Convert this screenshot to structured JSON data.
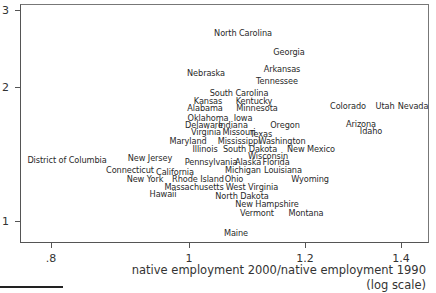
{
  "chart_data": {
    "type": "scatter",
    "title": "",
    "xlabel": "native employment 2000/native employment 1990 (log scale)",
    "xlabel_lines": [
      "native employment 2000/native employment 1990",
      "(log scale)"
    ],
    "ylabel": "",
    "x_scale": "log",
    "y_scale": "log",
    "xlim": [
      0.75,
      1.45
    ],
    "ylim": [
      0.93,
      3.05
    ],
    "grid": false,
    "legend": "none",
    "marker": "text-labels",
    "x_ticks": [
      {
        "label": ".8",
        "px": 51
      },
      {
        "label": "1",
        "px": 189
      },
      {
        "label": "1.2",
        "px": 305
      },
      {
        "label": "1.4",
        "px": 401
      }
    ],
    "y_ticks": [
      {
        "label": "3",
        "py": 10
      },
      {
        "label": "2",
        "py": 87
      },
      {
        "label": "1",
        "py": 221
      }
    ],
    "points": [
      {
        "label": "North Carolina",
        "x": 1.12,
        "y": 2.62,
        "px": 243,
        "py": 33
      },
      {
        "label": "Georgia",
        "x": 1.18,
        "y": 2.38,
        "px": 289,
        "py": 52
      },
      {
        "label": "Arkansas",
        "x": 1.15,
        "y": 2.15,
        "px": 282,
        "py": 69
      },
      {
        "label": "Nebraska",
        "x": 1.03,
        "y": 2.11,
        "px": 206,
        "py": 73
      },
      {
        "label": "Tennessee",
        "x": 1.14,
        "y": 2.02,
        "px": 277,
        "py": 81
      },
      {
        "label": "South Carolina",
        "x": 1.08,
        "y": 1.87,
        "px": 239,
        "py": 93
      },
      {
        "label": "Kansas",
        "x": 1.0,
        "y": 1.8,
        "px": 208,
        "py": 101
      },
      {
        "label": "Kentucky",
        "x": 1.1,
        "y": 1.8,
        "px": 254,
        "py": 101
      },
      {
        "label": "Alabama",
        "x": 1.0,
        "y": 1.74,
        "px": 205,
        "py": 108
      },
      {
        "label": "Minnesota",
        "x": 1.11,
        "y": 1.74,
        "px": 257,
        "py": 108
      },
      {
        "label": "Colorado",
        "x": 1.3,
        "y": 1.74,
        "px": 348,
        "py": 106
      },
      {
        "label": "Utah",
        "x": 1.36,
        "y": 1.74,
        "px": 385,
        "py": 106
      },
      {
        "label": "Nevada",
        "x": 1.43,
        "y": 1.74,
        "px": 413,
        "py": 106
      },
      {
        "label": "Oklahoma",
        "x": 1.01,
        "y": 1.66,
        "px": 208,
        "py": 118
      },
      {
        "label": "Iowa",
        "x": 1.09,
        "y": 1.66,
        "px": 243,
        "py": 118
      },
      {
        "label": "Delaware",
        "x": 0.97,
        "y": 1.62,
        "px": 204,
        "py": 125
      },
      {
        "label": "Indiana",
        "x": 1.05,
        "y": 1.62,
        "px": 233,
        "py": 125
      },
      {
        "label": "Oregon",
        "x": 1.14,
        "y": 1.62,
        "px": 285,
        "py": 125
      },
      {
        "label": "Arizona",
        "x": 1.32,
        "y": 1.62,
        "px": 361,
        "py": 124
      },
      {
        "label": "Idaho",
        "x": 1.35,
        "y": 1.58,
        "px": 371,
        "py": 131
      },
      {
        "label": "Virginia",
        "x": 0.99,
        "y": 1.56,
        "px": 206,
        "py": 132
      },
      {
        "label": "Missouri",
        "x": 1.05,
        "y": 1.56,
        "px": 239,
        "py": 132
      },
      {
        "label": "Texas",
        "x": 1.11,
        "y": 1.55,
        "px": 261,
        "py": 134
      },
      {
        "label": "Maryland",
        "x": 0.92,
        "y": 1.51,
        "px": 188,
        "py": 141
      },
      {
        "label": "Mississippi",
        "x": 1.06,
        "y": 1.51,
        "px": 239,
        "py": 141
      },
      {
        "label": "Washington",
        "x": 1.15,
        "y": 1.51,
        "px": 282,
        "py": 141
      },
      {
        "label": "Illinois",
        "x": 0.98,
        "y": 1.46,
        "px": 205,
        "py": 149
      },
      {
        "label": "South Dakota",
        "x": 1.06,
        "y": 1.46,
        "px": 250,
        "py": 149
      },
      {
        "label": "New Mexico",
        "x": 1.18,
        "y": 1.46,
        "px": 311,
        "py": 149
      },
      {
        "label": "Wisconsin",
        "x": 1.09,
        "y": 1.42,
        "px": 268,
        "py": 156
      },
      {
        "label": "District of Columbia",
        "x": 0.73,
        "y": 1.4,
        "px": 67,
        "py": 160
      },
      {
        "label": "New Jersey",
        "x": 0.91,
        "y": 1.4,
        "px": 150,
        "py": 158
      },
      {
        "label": "Pennsylvania",
        "x": 1.0,
        "y": 1.39,
        "px": 211,
        "py": 162
      },
      {
        "label": "Alaska",
        "x": 1.06,
        "y": 1.39,
        "px": 248,
        "py": 162
      },
      {
        "label": "Florida",
        "x": 1.1,
        "y": 1.39,
        "px": 276,
        "py": 162
      },
      {
        "label": "Connecticut",
        "x": 0.9,
        "y": 1.35,
        "px": 130,
        "py": 170
      },
      {
        "label": "California",
        "x": 0.95,
        "y": 1.34,
        "px": 175,
        "py": 172
      },
      {
        "label": "Michigan",
        "x": 1.04,
        "y": 1.35,
        "px": 243,
        "py": 170
      },
      {
        "label": "Louisiana",
        "x": 1.11,
        "y": 1.35,
        "px": 283,
        "py": 170
      },
      {
        "label": "New York",
        "x": 0.86,
        "y": 1.31,
        "px": 145,
        "py": 179
      },
      {
        "label": "Rhode Island",
        "x": 0.96,
        "y": 1.31,
        "px": 198,
        "py": 179
      },
      {
        "label": "Ohio",
        "x": 1.02,
        "y": 1.31,
        "px": 234,
        "py": 179
      },
      {
        "label": "Wyoming",
        "x": 1.2,
        "y": 1.31,
        "px": 310,
        "py": 179
      },
      {
        "label": "Massachusetts",
        "x": 0.93,
        "y": 1.27,
        "px": 194,
        "py": 187
      },
      {
        "label": "West Virginia",
        "x": 1.03,
        "y": 1.27,
        "px": 252,
        "py": 187
      },
      {
        "label": "Hawaii",
        "x": 0.91,
        "y": 1.24,
        "px": 163,
        "py": 194
      },
      {
        "label": "North Dakota",
        "x": 1.02,
        "y": 1.23,
        "px": 242,
        "py": 196
      },
      {
        "label": "New Hampshire",
        "x": 1.06,
        "y": 1.19,
        "px": 267,
        "py": 204
      },
      {
        "label": "Vermont",
        "x": 1.06,
        "y": 1.15,
        "px": 257,
        "py": 213
      },
      {
        "label": "Montana",
        "x": 1.13,
        "y": 1.15,
        "px": 306,
        "py": 213
      },
      {
        "label": "Maine",
        "x": 1.02,
        "y": 1.03,
        "px": 236,
        "py": 233
      }
    ]
  }
}
